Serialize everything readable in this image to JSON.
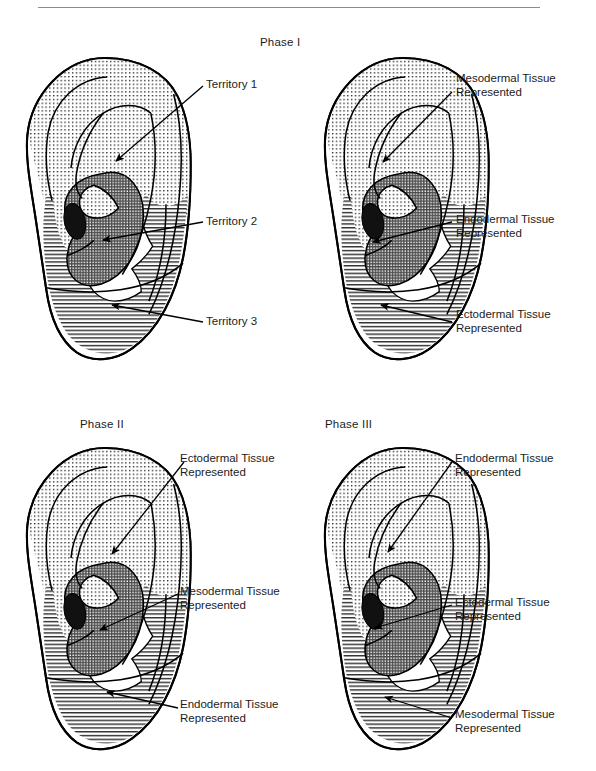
{
  "figure": {
    "type": "anatomical-diagram",
    "panel_count": 4,
    "patterns": {
      "dotted": "stippled / dotted fill",
      "crosshatch": "cross-hatched grid fill",
      "horizontal": "horizontal line fill",
      "solid_black": "solid black concha spot"
    },
    "colors": {
      "ink": "#1c1c1c",
      "rule": "#8b8b8b",
      "outline": "#000000",
      "fill_white": "#ffffff",
      "fill_black": "#111111"
    }
  },
  "top_rule": {
    "visible": true
  },
  "panels": [
    {
      "id": "panel-top-left",
      "phase_label": "Phase I",
      "phase_label_shared": true,
      "annotations": [
        {
          "id": "territory-1",
          "lines": [
            "Territory 1"
          ],
          "target_region": "dotted"
        },
        {
          "id": "territory-2",
          "lines": [
            "Territory 2"
          ],
          "target_region": "crosshatch"
        },
        {
          "id": "territory-3",
          "lines": [
            "Territory 3"
          ],
          "target_region": "horizontal"
        }
      ]
    },
    {
      "id": "panel-top-right",
      "phase_label": "Phase I",
      "annotations": [
        {
          "id": "mesodermal-tissue",
          "lines": [
            "Mesodermal Tissue",
            "Represented"
          ],
          "target_region": "dotted"
        },
        {
          "id": "endodermal-tissue",
          "lines": [
            "Endodermal Tissue",
            "Represented"
          ],
          "target_region": "crosshatch"
        },
        {
          "id": "ectodermal-tissue",
          "lines": [
            "Ectodermal Tissue",
            "Represented"
          ],
          "target_region": "horizontal"
        }
      ]
    },
    {
      "id": "panel-bottom-left",
      "phase_label": "Phase II",
      "annotations": [
        {
          "id": "ectodermal-tissue",
          "lines": [
            "Ectodermal Tissue",
            "Represented"
          ],
          "target_region": "dotted"
        },
        {
          "id": "mesodermal-tissue",
          "lines": [
            "Mesodermal Tissue",
            "Represented"
          ],
          "target_region": "crosshatch"
        },
        {
          "id": "endodermal-tissue",
          "lines": [
            "Endodermal Tissue",
            "Represented"
          ],
          "target_region": "horizontal"
        }
      ]
    },
    {
      "id": "panel-bottom-right",
      "phase_label": "Phase III",
      "annotations": [
        {
          "id": "endodermal-tissue",
          "lines": [
            "Endodermal Tissue",
            "Represented"
          ],
          "target_region": "dotted"
        },
        {
          "id": "ectodermal-tissue",
          "lines": [
            "Ectodermal Tissue",
            "Represented"
          ],
          "target_region": "crosshatch"
        },
        {
          "id": "mesodermal-tissue",
          "lines": [
            "Mesodermal Tissue",
            "Represented"
          ],
          "target_region": "horizontal"
        }
      ]
    }
  ],
  "labels": {
    "phase1": "Phase I",
    "phase2": "Phase II",
    "phase3": "Phase III",
    "territory1": "Territory 1",
    "territory2": "Territory 2",
    "territory3": "Territory 3",
    "meso_l1": "Mesodermal Tissue",
    "meso_l2": "Represented",
    "endo_l1": "Endodermal Tissue",
    "endo_l2": "Represented",
    "ecto_l1": "Ectodermal Tissue",
    "ecto_l2": "Represented"
  }
}
